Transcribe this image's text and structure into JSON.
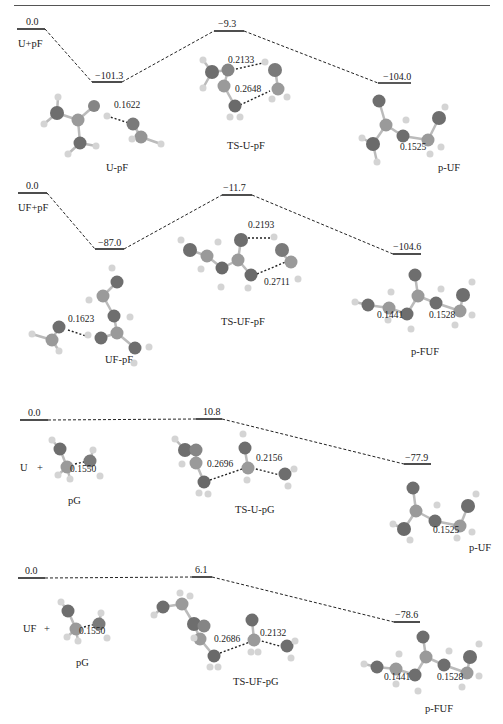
{
  "figure": {
    "type": "reaction-energy-profile",
    "panels": [
      {
        "id": "U-pF",
        "reactant_label": "U+pF",
        "levels": [
          {
            "name": "reactant",
            "energy": "0.0"
          },
          {
            "name": "complex",
            "energy": "−101.3",
            "species": "U-pF"
          },
          {
            "name": "transition-state",
            "energy": "−9.3",
            "species": "TS-U-pF"
          },
          {
            "name": "product",
            "energy": "−104.0",
            "species": "p-UF"
          }
        ],
        "distances": [
          "0.1622",
          "0.2133",
          "0.2648",
          "0.1525"
        ]
      },
      {
        "id": "UF-pF",
        "reactant_label": "UF+pF",
        "levels": [
          {
            "name": "reactant",
            "energy": "0.0"
          },
          {
            "name": "complex",
            "energy": "−87.0",
            "species": "UF-pF"
          },
          {
            "name": "transition-state",
            "energy": "−11.7",
            "species": "TS-UF-pF"
          },
          {
            "name": "product",
            "energy": "−104.6",
            "species": "p-FUF"
          }
        ],
        "distances": [
          "0.1623",
          "0.2193",
          "0.2711",
          "0.1441",
          "0.1528"
        ]
      },
      {
        "id": "U-pG",
        "reactant_label": "U",
        "plus": "+",
        "reactant_species": "pG",
        "levels": [
          {
            "name": "reactant",
            "energy": "0.0"
          },
          {
            "name": "transition-state",
            "energy": "10.8",
            "species": "TS-U-pG"
          },
          {
            "name": "product",
            "energy": "−77.9",
            "species": "p-UF"
          }
        ],
        "distances": [
          "0.1550",
          "0.2696",
          "0.2156",
          "0.1525"
        ]
      },
      {
        "id": "UF-pG",
        "reactant_label": "UF",
        "plus": "+",
        "reactant_species": "pG",
        "levels": [
          {
            "name": "reactant",
            "energy": "0.0"
          },
          {
            "name": "transition-state",
            "energy": "6.1",
            "species": "TS-UF-pG"
          },
          {
            "name": "product",
            "energy": "−78.6",
            "species": "p-FUF"
          }
        ],
        "distances": [
          "0.1550",
          "0.2686",
          "0.2132",
          "0.1441",
          "0.1528"
        ]
      }
    ]
  },
  "colors": {
    "carbon": "#6e6e6e",
    "oxygen_or_heavy": "#8a8a8a",
    "hydrogen": "#d4d4d4",
    "line": "#222222"
  }
}
